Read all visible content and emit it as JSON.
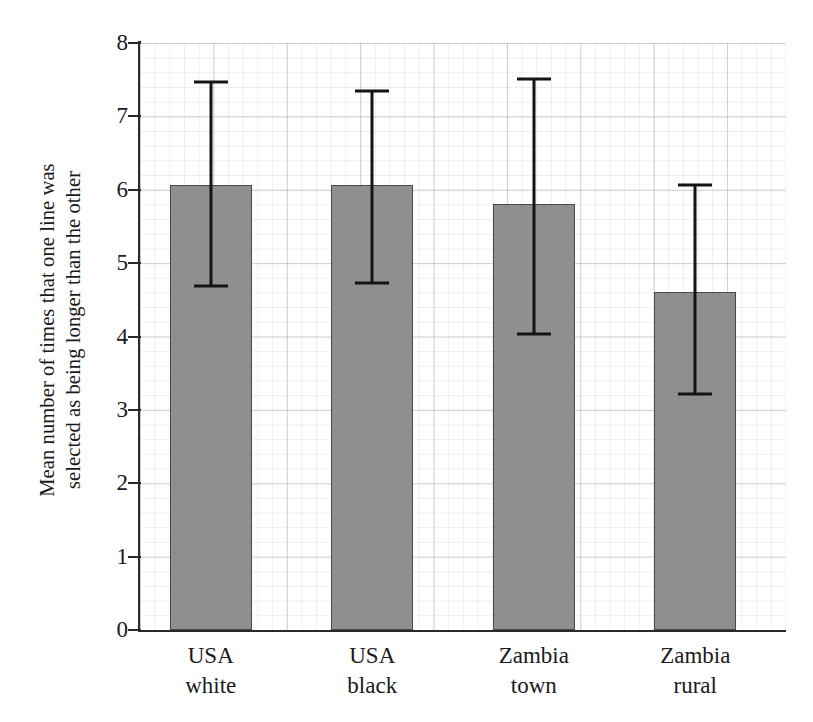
{
  "chart_data": {
    "type": "bar",
    "title": "",
    "xlabel": "",
    "ylabel_line1": "Mean number of times that one line was",
    "ylabel_line2": "selected as being longer than the other",
    "categories": [
      "USA white",
      "USA black",
      "Zambia town",
      "Zambia rural"
    ],
    "category_lines": [
      {
        "line1": "USA",
        "line2": "white"
      },
      {
        "line1": "USA",
        "line2": "black"
      },
      {
        "line1": "Zambia",
        "line2": "town"
      },
      {
        "line1": "Zambia",
        "line2": "rural"
      }
    ],
    "values": [
      6.06,
      6.07,
      5.8,
      4.6
    ],
    "error_upper": [
      7.47,
      7.35,
      7.51,
      6.07
    ],
    "error_lower": [
      4.69,
      4.73,
      4.04,
      3.21
    ],
    "ylim": [
      0,
      8
    ],
    "ytick_values": [
      0,
      1,
      2,
      3,
      4,
      5,
      6,
      7,
      8
    ],
    "ytick_labels": [
      "0",
      "1",
      "2",
      "3",
      "4",
      "5",
      "6",
      "7",
      "8"
    ],
    "grid": true,
    "grid_style": "graph-paper",
    "legend": "none",
    "bar_color": "#8f8f8f",
    "bar_edge_color": "#4a4a4a",
    "error_bar_color": "#141414",
    "axis_color": "#2a2a2a",
    "background_color": "#ffffff"
  }
}
